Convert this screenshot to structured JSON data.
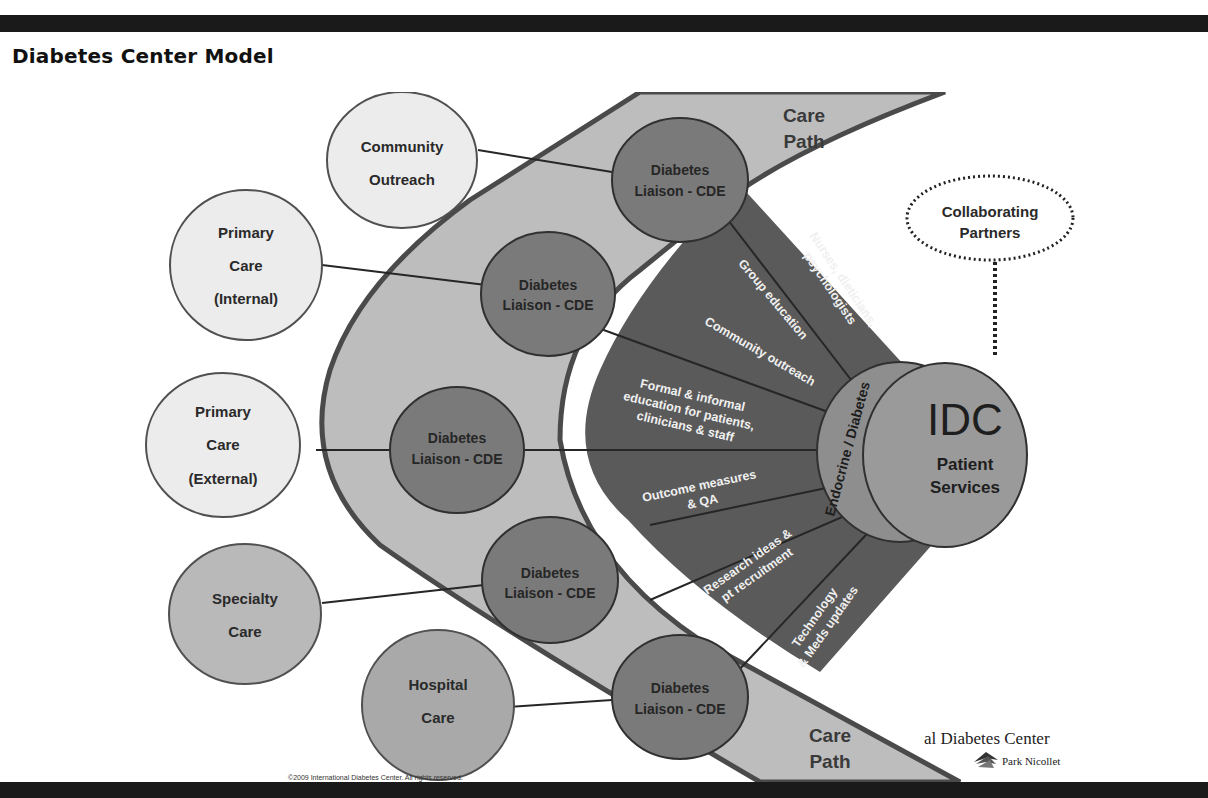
{
  "page": {
    "title": "Diabetes Center Model"
  },
  "diagram": {
    "care_path_label_top": [
      "Care",
      "Path"
    ],
    "care_path_label_bottom": [
      "Care",
      "Path"
    ],
    "outer_nodes": [
      {
        "id": "community-outreach",
        "lines": [
          "Community",
          "Outreach"
        ],
        "fill": "#ececec"
      },
      {
        "id": "primary-care-internal",
        "lines": [
          "Primary",
          "Care",
          "(Internal)"
        ],
        "fill": "#ececec"
      },
      {
        "id": "primary-care-external",
        "lines": [
          "Primary",
          "Care",
          "(External)"
        ],
        "fill": "#ececec"
      },
      {
        "id": "specialty-care",
        "lines": [
          "Specialty",
          "Care"
        ],
        "fill": "#b9b9b9"
      },
      {
        "id": "hospital-care",
        "lines": [
          "Hospital",
          "Care"
        ],
        "fill": "#a9a9a9"
      }
    ],
    "liaison_nodes": [
      {
        "lines": [
          "Diabetes",
          "Liaison - CDE"
        ]
      },
      {
        "lines": [
          "Diabetes",
          "Liaison - CDE"
        ]
      },
      {
        "lines": [
          "Diabetes",
          "Liaison - CDE"
        ]
      },
      {
        "lines": [
          "Diabetes",
          "Liaison - CDE"
        ]
      },
      {
        "lines": [
          "Diabetes",
          "Liaison - CDE"
        ]
      }
    ],
    "services": [
      {
        "lines": [
          "Nurses, dieticians,",
          "psychologists"
        ]
      },
      {
        "lines": [
          "Group education"
        ]
      },
      {
        "lines": [
          "Community outreach"
        ]
      },
      {
        "lines": [
          "Formal & informal",
          "education for patients,",
          "clinicians & staff"
        ]
      },
      {
        "lines": [
          "Outcome measures",
          "& QA"
        ]
      },
      {
        "lines": [
          "Research ideas &",
          "pt recruitment"
        ]
      },
      {
        "lines": [
          "Technology",
          "& Meds updates"
        ]
      }
    ],
    "ring_label": "Endocrine / Diabetes",
    "center": {
      "title": "IDC",
      "subtitle_lines": [
        "Patient",
        "Services"
      ]
    },
    "partners": {
      "lines": [
        "Collaborating",
        "Partners"
      ]
    },
    "colors": {
      "care_path_fill": "#bdbdbd",
      "care_path_stroke": "#4a4a4a",
      "fan_fill": "#5a5a5a",
      "liaison_fill": "#7a7a7a",
      "ring_fill": "#8e8e8e",
      "center_fill": "#9a9a9a",
      "text_dark": "#2a2a2a",
      "text_light": "#f0f0f0"
    }
  },
  "footer": {
    "copyright": "©2009 International Diabetes Center. All rights reserved.",
    "logo_line1": "al Diabetes Center",
    "logo_line2": "Park Nicollet"
  }
}
